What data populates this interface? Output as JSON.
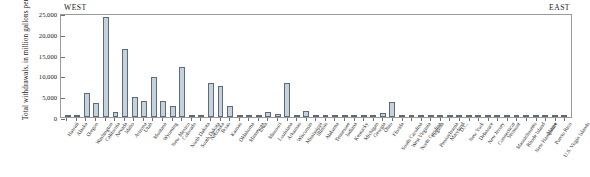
{
  "figure": {
    "region_west_label": "WEST",
    "region_east_label": "EAST"
  },
  "chart_data": {
    "type": "bar",
    "title": "",
    "subtitle": "",
    "xlabel": "",
    "ylabel": "Total withdrawals, in million gallons per day",
    "ylim": [
      0,
      25000
    ],
    "yticks": [
      0,
      5000,
      10000,
      15000,
      20000,
      25000
    ],
    "ytick_labels": [
      "0",
      "5,000",
      "10,000",
      "15,000",
      "20,000",
      "25,000"
    ],
    "grid": false,
    "legend": null,
    "bar_color": "#c4d2e0",
    "bar_edge_color": "#5f6a74",
    "annotations": [
      "WEST",
      "EAST"
    ],
    "categories": [
      "Hawaii",
      "Alaska",
      "Oregon",
      "Washington",
      "California",
      "Nevada",
      "Idaho",
      "Arizona",
      "Utah",
      "Montana",
      "Wyoming",
      "New Mexico",
      "Colorado",
      "North Dakota",
      "South Dakota",
      "Nebraska",
      "Texas",
      "Kansas",
      "Oklahoma",
      "Minnesota",
      "Iowa",
      "Missouri",
      "Louisiana",
      "Arkansas",
      "Wisconsin",
      "Mississippi",
      "Illinois",
      "Alabama",
      "Tennessee",
      "Indiana",
      "Kentucky",
      "Michigan",
      "Georgia",
      "Ohio",
      "Florida",
      "South Carolina",
      "West Virginia",
      "North Carolina",
      "Virginia",
      "Pennsylvania",
      "Maryland",
      "D.C.",
      "New York",
      "Delaware",
      "New Jersey",
      "Connecticut",
      "Vermont",
      "Massachusetts",
      "Rhode Island",
      "New Hampshire",
      "Maine",
      "Puerto Rico",
      "U.S. Virgin Islands"
    ],
    "values": [
      120,
      130,
      5800,
      3400,
      24500,
      1300,
      16600,
      4900,
      4000,
      9700,
      4000,
      2800,
      12200,
      90,
      180,
      8400,
      7700,
      2700,
      300,
      220,
      140,
      1300,
      800,
      8400,
      130,
      1500,
      600,
      380,
      110,
      130,
      90,
      120,
      110,
      900,
      3700,
      180,
      110,
      120,
      250,
      330,
      190,
      40,
      230,
      60,
      90,
      70,
      40,
      80,
      50,
      40,
      60,
      80,
      40
    ]
  }
}
